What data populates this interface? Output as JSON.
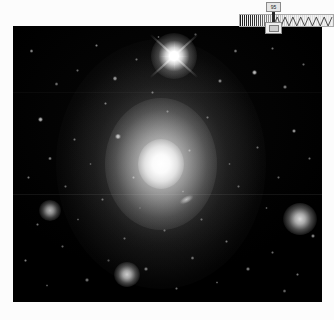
{
  "viewer": {
    "title": "Astronomical Image Viewer",
    "frame_label": "sky-image"
  },
  "scale_widget": {
    "name": "intensity-scale-bar",
    "tooltip_value": "95",
    "marker_label": "scale-handle"
  },
  "image_content": {
    "description": "Deep-sky exposure of a bright elliptical galaxy surrounded by a star field",
    "background_color": "#000000",
    "border_color": "#ffffff",
    "objects": [
      {
        "id": "central-galaxy",
        "type": "elliptical-galaxy",
        "x_pct": 48,
        "y_pct": 50,
        "brightness": 1.0
      },
      {
        "id": "bright-star-spikes",
        "type": "star-diffraction",
        "x_pct": 52,
        "y_pct": 11,
        "brightness": 1.0
      },
      {
        "id": "companion-galaxy",
        "type": "companion",
        "x_pct": 56,
        "y_pct": 63,
        "brightness": 0.6
      },
      {
        "id": "fuzzy-right",
        "type": "fuzzy-object",
        "x_pct": 93,
        "y_pct": 70,
        "brightness": 0.85
      },
      {
        "id": "fuzzy-left",
        "type": "fuzzy-object",
        "x_pct": 12,
        "y_pct": 67,
        "brightness": 0.7
      },
      {
        "id": "fuzzy-bottom",
        "type": "fuzzy-object",
        "x_pct": 37,
        "y_pct": 90,
        "brightness": 0.8
      }
    ],
    "stars": [
      {
        "x": 6,
        "y": 9,
        "r": 1.6,
        "b": 0.55
      },
      {
        "x": 14,
        "y": 21,
        "r": 1.3,
        "b": 0.45
      },
      {
        "x": 9,
        "y": 34,
        "r": 2.0,
        "b": 0.7
      },
      {
        "x": 21,
        "y": 16,
        "r": 1.2,
        "b": 0.4
      },
      {
        "x": 27,
        "y": 7,
        "r": 1.5,
        "b": 0.5
      },
      {
        "x": 33,
        "y": 19,
        "r": 1.8,
        "b": 0.62
      },
      {
        "x": 40,
        "y": 12,
        "r": 1.2,
        "b": 0.42
      },
      {
        "x": 30,
        "y": 28,
        "r": 1.4,
        "b": 0.48
      },
      {
        "x": 20,
        "y": 41,
        "r": 1.3,
        "b": 0.44
      },
      {
        "x": 12,
        "y": 48,
        "r": 1.6,
        "b": 0.52
      },
      {
        "x": 5,
        "y": 55,
        "r": 1.4,
        "b": 0.46
      },
      {
        "x": 17,
        "y": 58,
        "r": 1.2,
        "b": 0.4
      },
      {
        "x": 8,
        "y": 72,
        "r": 1.3,
        "b": 0.44
      },
      {
        "x": 4,
        "y": 85,
        "r": 1.5,
        "b": 0.5
      },
      {
        "x": 16,
        "y": 80,
        "r": 1.2,
        "b": 0.38
      },
      {
        "x": 24,
        "y": 92,
        "r": 1.4,
        "b": 0.46
      },
      {
        "x": 21,
        "y": 70,
        "r": 1.1,
        "b": 0.35
      },
      {
        "x": 29,
        "y": 63,
        "r": 1.3,
        "b": 0.42
      },
      {
        "x": 36,
        "y": 77,
        "r": 1.2,
        "b": 0.38
      },
      {
        "x": 34,
        "y": 40,
        "r": 2.2,
        "b": 0.78
      },
      {
        "x": 39,
        "y": 55,
        "r": 1.4,
        "b": 0.46
      },
      {
        "x": 45,
        "y": 24,
        "r": 1.3,
        "b": 0.44
      },
      {
        "x": 50,
        "y": 31,
        "r": 1.2,
        "b": 0.4
      },
      {
        "x": 43,
        "y": 88,
        "r": 1.5,
        "b": 0.5
      },
      {
        "x": 49,
        "y": 74,
        "r": 1.2,
        "b": 0.38
      },
      {
        "x": 53,
        "y": 95,
        "r": 1.3,
        "b": 0.42
      },
      {
        "x": 58,
        "y": 84,
        "r": 1.4,
        "b": 0.46
      },
      {
        "x": 61,
        "y": 70,
        "r": 1.2,
        "b": 0.38
      },
      {
        "x": 57,
        "y": 45,
        "r": 1.3,
        "b": 0.42
      },
      {
        "x": 63,
        "y": 33,
        "r": 1.2,
        "b": 0.4
      },
      {
        "x": 67,
        "y": 20,
        "r": 1.6,
        "b": 0.54
      },
      {
        "x": 72,
        "y": 9,
        "r": 1.4,
        "b": 0.48
      },
      {
        "x": 78,
        "y": 17,
        "r": 2.1,
        "b": 0.74
      },
      {
        "x": 84,
        "y": 8,
        "r": 1.3,
        "b": 0.44
      },
      {
        "x": 88,
        "y": 22,
        "r": 1.5,
        "b": 0.5
      },
      {
        "x": 94,
        "y": 14,
        "r": 1.2,
        "b": 0.4
      },
      {
        "x": 91,
        "y": 38,
        "r": 1.8,
        "b": 0.62
      },
      {
        "x": 96,
        "y": 48,
        "r": 1.3,
        "b": 0.42
      },
      {
        "x": 86,
        "y": 55,
        "r": 1.2,
        "b": 0.38
      },
      {
        "x": 79,
        "y": 44,
        "r": 1.3,
        "b": 0.42
      },
      {
        "x": 73,
        "y": 58,
        "r": 1.2,
        "b": 0.38
      },
      {
        "x": 82,
        "y": 66,
        "r": 1.1,
        "b": 0.34
      },
      {
        "x": 69,
        "y": 78,
        "r": 1.4,
        "b": 0.46
      },
      {
        "x": 76,
        "y": 88,
        "r": 1.5,
        "b": 0.5
      },
      {
        "x": 84,
        "y": 82,
        "r": 1.3,
        "b": 0.42
      },
      {
        "x": 92,
        "y": 90,
        "r": 1.4,
        "b": 0.46
      },
      {
        "x": 97,
        "y": 76,
        "r": 1.6,
        "b": 0.54
      },
      {
        "x": 66,
        "y": 93,
        "r": 1.2,
        "b": 0.38
      },
      {
        "x": 88,
        "y": 96,
        "r": 1.3,
        "b": 0.42
      },
      {
        "x": 47,
        "y": 4,
        "r": 1.2,
        "b": 0.4
      },
      {
        "x": 59,
        "y": 3,
        "r": 1.1,
        "b": 0.34
      },
      {
        "x": 25,
        "y": 50,
        "r": 1.1,
        "b": 0.32
      },
      {
        "x": 70,
        "y": 50,
        "r": 1.1,
        "b": 0.32
      },
      {
        "x": 55,
        "y": 60,
        "r": 1.0,
        "b": 0.3
      },
      {
        "x": 41,
        "y": 66,
        "r": 1.0,
        "b": 0.3
      },
      {
        "x": 11,
        "y": 94,
        "r": 1.2,
        "b": 0.36
      },
      {
        "x": 31,
        "y": 85,
        "r": 1.1,
        "b": 0.32
      }
    ]
  }
}
